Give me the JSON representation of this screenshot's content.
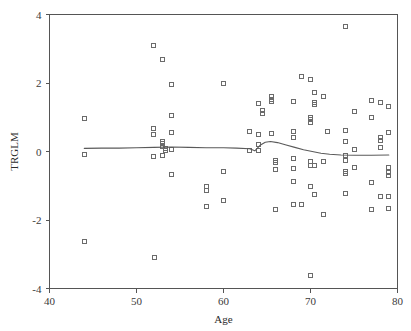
{
  "chart_data": {
    "type": "scatter",
    "title": "",
    "xlabel": "Age",
    "ylabel": "TRGLM",
    "xlim": [
      40,
      80
    ],
    "ylim": [
      -4,
      4
    ],
    "xticks": [
      40,
      50,
      60,
      70,
      80
    ],
    "yticks": [
      -4,
      -2,
      0,
      2,
      4
    ],
    "xtick_labels": [
      "40",
      "50",
      "60",
      "70",
      "80"
    ],
    "ytick_labels": [
      "-4",
      "-2",
      "0",
      "2",
      "4"
    ],
    "grid": false,
    "legend": "none",
    "marker": "open-square",
    "marker_color": "#6b6b6b",
    "line_color": "#5a5a5a",
    "points": [
      [
        44.0,
        0.95
      ],
      [
        44.0,
        -0.1
      ],
      [
        44.0,
        -2.62
      ],
      [
        52.0,
        3.1
      ],
      [
        52.0,
        0.66
      ],
      [
        52.0,
        0.5
      ],
      [
        52.0,
        -0.16
      ],
      [
        52.1,
        -3.1
      ],
      [
        53.0,
        2.7
      ],
      [
        53.0,
        0.3
      ],
      [
        53.0,
        0.22
      ],
      [
        53.0,
        0.14
      ],
      [
        53.0,
        -0.12
      ],
      [
        53.3,
        0.1
      ],
      [
        53.3,
        0.04
      ],
      [
        54.0,
        1.95
      ],
      [
        54.0,
        1.05
      ],
      [
        54.0,
        0.55
      ],
      [
        54.0,
        0.05
      ],
      [
        54.0,
        -0.68
      ],
      [
        58.0,
        -1.02
      ],
      [
        58.0,
        -1.15
      ],
      [
        58.0,
        -1.62
      ],
      [
        60.0,
        1.98
      ],
      [
        60.0,
        -0.58
      ],
      [
        60.0,
        -1.42
      ],
      [
        63.0,
        0.58
      ],
      [
        63.0,
        0.04
      ],
      [
        64.0,
        1.4
      ],
      [
        64.0,
        0.5
      ],
      [
        64.0,
        0.2
      ],
      [
        64.0,
        0.02
      ],
      [
        64.5,
        1.2
      ],
      [
        64.5,
        1.12
      ],
      [
        65.5,
        1.62
      ],
      [
        65.5,
        1.52
      ],
      [
        65.5,
        1.45
      ],
      [
        65.5,
        0.52
      ],
      [
        66.0,
        -0.25
      ],
      [
        66.0,
        -0.33
      ],
      [
        66.0,
        -0.52
      ],
      [
        66.0,
        -1.7
      ],
      [
        68.0,
        1.45
      ],
      [
        68.0,
        0.58
      ],
      [
        68.0,
        0.42
      ],
      [
        68.0,
        -0.2
      ],
      [
        68.0,
        -0.5
      ],
      [
        68.0,
        -0.88
      ],
      [
        68.0,
        -1.55
      ],
      [
        69.0,
        2.18
      ],
      [
        69.0,
        -1.55
      ],
      [
        70.0,
        2.1
      ],
      [
        70.0,
        1.0
      ],
      [
        70.0,
        0.92
      ],
      [
        70.0,
        0.86
      ],
      [
        70.0,
        -0.3
      ],
      [
        70.0,
        -0.42
      ],
      [
        70.0,
        -1.02
      ],
      [
        70.0,
        -3.62
      ],
      [
        70.5,
        1.72
      ],
      [
        70.5,
        1.42
      ],
      [
        70.5,
        1.36
      ],
      [
        70.5,
        -0.4
      ],
      [
        70.5,
        -1.25
      ],
      [
        71.5,
        1.62
      ],
      [
        71.5,
        -0.28
      ],
      [
        71.5,
        -1.85
      ],
      [
        72.0,
        0.58
      ],
      [
        74.0,
        3.65
      ],
      [
        74.0,
        0.62
      ],
      [
        74.0,
        0.28
      ],
      [
        74.0,
        -0.12
      ],
      [
        74.0,
        -0.25
      ],
      [
        74.0,
        -0.58
      ],
      [
        74.0,
        -0.65
      ],
      [
        74.0,
        -1.22
      ],
      [
        75.0,
        1.18
      ],
      [
        75.0,
        0.05
      ],
      [
        75.0,
        -0.46
      ],
      [
        77.0,
        1.48
      ],
      [
        77.0,
        0.98
      ],
      [
        77.0,
        -0.9
      ],
      [
        77.0,
        -1.68
      ],
      [
        78.0,
        1.42
      ],
      [
        78.0,
        0.42
      ],
      [
        78.0,
        0.32
      ],
      [
        78.0,
        0.12
      ],
      [
        78.0,
        -1.32
      ],
      [
        79.0,
        1.3
      ],
      [
        79.0,
        0.55
      ],
      [
        79.0,
        -0.48
      ],
      [
        79.0,
        -0.62
      ],
      [
        79.0,
        -0.7
      ],
      [
        79.0,
        -1.32
      ],
      [
        79.0,
        -1.65
      ]
    ],
    "smooth_line": {
      "name": "loess-smoother",
      "x": [
        44.0,
        46.0,
        48.0,
        50.0,
        52.0,
        54.0,
        56.0,
        58.0,
        60.0,
        61.5,
        63.0,
        63.6,
        64.2,
        64.8,
        65.4,
        66.2,
        67.2,
        68.2,
        69.2,
        70.2,
        71.2,
        72.2,
        73.5,
        75.0,
        77.0,
        79.0
      ],
      "y": [
        0.09,
        0.1,
        0.1,
        0.11,
        0.12,
        0.13,
        0.12,
        0.11,
        0.11,
        0.1,
        0.08,
        0.02,
        0.18,
        0.27,
        0.29,
        0.26,
        0.19,
        0.12,
        0.05,
        0.0,
        -0.05,
        -0.08,
        -0.1,
        -0.11,
        -0.11,
        -0.1
      ]
    }
  },
  "axes": {
    "x_title": "Age",
    "y_title": "TRGLM"
  }
}
